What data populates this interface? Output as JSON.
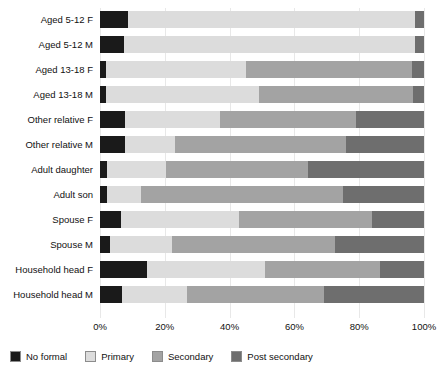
{
  "chart_data": {
    "type": "bar",
    "subtype": "stacked-horizontal-100percent",
    "title": "",
    "xlabel": "",
    "ylabel": "",
    "xlim": [
      0,
      100
    ],
    "xticks": [
      "0%",
      "20%",
      "40%",
      "60%",
      "80%",
      "100%"
    ],
    "xtick_values": [
      0,
      20,
      40,
      60,
      80,
      100
    ],
    "grid": true,
    "legend_position": "bottom-left",
    "categories": [
      "Aged 5-12 F",
      "Aged 5-12 M",
      "Aged 13-18 F",
      "Aged 13-18 M",
      "Other relative F",
      "Other relative M",
      "Adult daughter",
      "Adult son",
      "Spouse F",
      "Spouse M",
      "Household head F",
      "Household head M"
    ],
    "series": [
      {
        "name": "No formal",
        "color": "#1a1a1a",
        "values": [
          8.6,
          7.4,
          1.9,
          1.9,
          7.7,
          7.7,
          2.2,
          2.2,
          6.5,
          3.1,
          14.5,
          6.8
        ]
      },
      {
        "name": "Primary",
        "color": "#dcdcdc",
        "values": [
          88.6,
          89.8,
          43.2,
          47.2,
          29.3,
          15.4,
          18.2,
          10.5,
          36.4,
          19.1,
          36.4,
          20.2
        ]
      },
      {
        "name": "Secondary",
        "color": "#a3a3a3",
        "values": [
          0.0,
          0.0,
          51.2,
          47.5,
          42.0,
          52.8,
          43.8,
          62.3,
          41.1,
          50.3,
          35.5,
          42.0
        ]
      },
      {
        "name": "Post secondary",
        "color": "#6e6e6e",
        "values": [
          2.8,
          2.8,
          3.7,
          3.4,
          21.0,
          24.1,
          35.8,
          25.0,
          16.0,
          27.5,
          13.6,
          31.0
        ]
      }
    ]
  },
  "legend": {
    "items": [
      {
        "label": "No formal",
        "color": "#1a1a1a"
      },
      {
        "label": "Primary",
        "color": "#dcdcdc"
      },
      {
        "label": "Secondary",
        "color": "#a3a3a3"
      },
      {
        "label": "Post secondary",
        "color": "#6e6e6e"
      }
    ]
  }
}
